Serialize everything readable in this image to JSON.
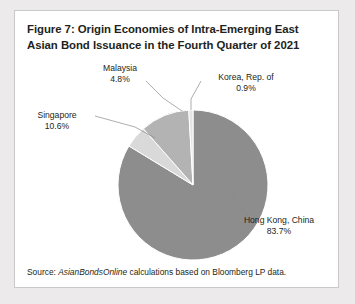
{
  "figure": {
    "title": "Figure 7: Origin Economies of Intra-Emerging East Asian Bond Issuance in the Fourth Quarter of 2021",
    "source_prefix": "Source:",
    "source_italic": "AsianBondsOnline",
    "source_rest": "calculations based on Bloomberg LP data."
  },
  "labels": {
    "malaysia_name": "Malaysia",
    "malaysia_pct": "4.8%",
    "korea_name": "Korea, Rep. of",
    "korea_pct": "0.9%",
    "singapore_name": "Singapore",
    "singapore_pct": "10.6%",
    "hongkong_name": "Hong Kong, China",
    "hongkong_pct": "83.7%"
  },
  "chart_data": {
    "type": "pie",
    "title": "Figure 7: Origin Economies of Intra-Emerging East Asian Bond Issuance in the Fourth Quarter of 2021",
    "xlabel": "",
    "ylabel": "",
    "unit": "percent",
    "start_angle_deg": 0,
    "direction": "clockwise",
    "legend": "none",
    "labels_position": "outside-with-leader-lines",
    "categories": [
      "Hong Kong, China",
      "Malaysia",
      "Singapore",
      "Korea, Rep. of"
    ],
    "values": [
      83.7,
      4.8,
      10.6,
      0.9
    ],
    "total": 100.0,
    "colors": [
      "#8d8d8d",
      "#d9d9d9",
      "#b3b3b3",
      "#e4e4e4"
    ],
    "slices": [
      {
        "name": "Hong Kong, China",
        "value": 83.7,
        "color": "#8d8d8d"
      },
      {
        "name": "Malaysia",
        "value": 4.8,
        "color": "#d9d9d9"
      },
      {
        "name": "Singapore",
        "value": 10.6,
        "color": "#b3b3b3"
      },
      {
        "name": "Korea, Rep. of",
        "value": 0.9,
        "color": "#e4e4e4"
      }
    ]
  },
  "geometry": {
    "cx": 178,
    "cy": 130,
    "r": 75
  }
}
